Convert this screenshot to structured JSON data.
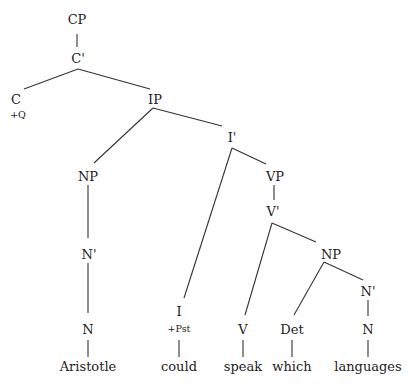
{
  "tree": {
    "nodes": [
      {
        "id": "cp",
        "label": "CP",
        "x": 77,
        "y": 24
      },
      {
        "id": "cbar",
        "label": "C'",
        "x": 78,
        "y": 60
      },
      {
        "id": "c",
        "label": "C",
        "x": 16,
        "y": 101
      },
      {
        "id": "c_feat",
        "label": "+Q",
        "x": 18,
        "y": 117
      },
      {
        "id": "ip",
        "label": "IP",
        "x": 155,
        "y": 101
      },
      {
        "id": "ibar",
        "label": "I'",
        "x": 232,
        "y": 139
      },
      {
        "id": "np1",
        "label": "NP",
        "x": 88,
        "y": 178
      },
      {
        "id": "vp",
        "label": "VP",
        "x": 275,
        "y": 178
      },
      {
        "id": "vbar",
        "label": "V'",
        "x": 273,
        "y": 213
      },
      {
        "id": "nbar1",
        "label": "N'",
        "x": 89,
        "y": 256
      },
      {
        "id": "np2",
        "label": "NP",
        "x": 331,
        "y": 256
      },
      {
        "id": "nbar2",
        "label": "N'",
        "x": 368,
        "y": 293
      },
      {
        "id": "n1",
        "label": "N",
        "x": 88,
        "y": 331
      },
      {
        "id": "i",
        "label": "I",
        "x": 179,
        "y": 313
      },
      {
        "id": "i_feat",
        "label": "+Pst",
        "x": 179,
        "y": 331
      },
      {
        "id": "v",
        "label": "V",
        "x": 243,
        "y": 331
      },
      {
        "id": "det",
        "label": "Det",
        "x": 292,
        "y": 331
      },
      {
        "id": "n2",
        "label": "N",
        "x": 368,
        "y": 331
      }
    ],
    "words": [
      {
        "id": "w_aristotle",
        "label": "Aristotle",
        "x": 88,
        "y": 371
      },
      {
        "id": "w_could",
        "label": "could",
        "x": 179,
        "y": 371
      },
      {
        "id": "w_speak",
        "label": "speak",
        "x": 243,
        "y": 371
      },
      {
        "id": "w_which",
        "label": "which",
        "x": 292,
        "y": 371
      },
      {
        "id": "w_languages",
        "label": "languages",
        "x": 368,
        "y": 371
      }
    ],
    "edges": [
      {
        "from": "CP",
        "to": "C'",
        "x1": 77,
        "y1": 34,
        "x2": 77,
        "y2": 47
      },
      {
        "from": "C'",
        "to": "C",
        "x1": 78,
        "y1": 69,
        "x2": 24,
        "y2": 89
      },
      {
        "from": "C'",
        "to": "IP",
        "x1": 78,
        "y1": 69,
        "x2": 150,
        "y2": 89
      },
      {
        "from": "IP",
        "to": "NP",
        "x1": 153,
        "y1": 108,
        "x2": 94,
        "y2": 163
      },
      {
        "from": "IP",
        "to": "I'",
        "x1": 153,
        "y1": 108,
        "x2": 222,
        "y2": 126
      },
      {
        "from": "NP",
        "to": "N'",
        "x1": 88,
        "y1": 185,
        "x2": 88,
        "y2": 238
      },
      {
        "from": "N'",
        "to": "N",
        "x1": 88,
        "y1": 263,
        "x2": 88,
        "y2": 313
      },
      {
        "from": "N",
        "to": "Aristotle",
        "x1": 88,
        "y1": 340,
        "x2": 88,
        "y2": 357
      },
      {
        "from": "I'",
        "to": "I",
        "x1": 232,
        "y1": 148,
        "x2": 184,
        "y2": 298
      },
      {
        "from": "I'",
        "to": "VP",
        "x1": 232,
        "y1": 148,
        "x2": 266,
        "y2": 164
      },
      {
        "from": "I",
        "to": "could",
        "x1": 179,
        "y1": 340,
        "x2": 179,
        "y2": 357
      },
      {
        "from": "VP",
        "to": "V'",
        "x1": 274,
        "y1": 185,
        "x2": 274,
        "y2": 200
      },
      {
        "from": "V'",
        "to": "V",
        "x1": 272,
        "y1": 223,
        "x2": 245,
        "y2": 315
      },
      {
        "from": "V'",
        "to": "NP",
        "x1": 272,
        "y1": 223,
        "x2": 316,
        "y2": 242
      },
      {
        "from": "V",
        "to": "speak",
        "x1": 243,
        "y1": 340,
        "x2": 243,
        "y2": 357
      },
      {
        "from": "NP",
        "to": "Det",
        "x1": 324,
        "y1": 262,
        "x2": 294,
        "y2": 315
      },
      {
        "from": "NP",
        "to": "N'",
        "x1": 324,
        "y1": 262,
        "x2": 363,
        "y2": 280
      },
      {
        "from": "Det",
        "to": "which",
        "x1": 292,
        "y1": 340,
        "x2": 292,
        "y2": 357
      },
      {
        "from": "N'",
        "to": "N",
        "x1": 368,
        "y1": 300,
        "x2": 368,
        "y2": 316
      },
      {
        "from": "N",
        "to": "languages",
        "x1": 368,
        "y1": 340,
        "x2": 368,
        "y2": 357
      }
    ],
    "line_color": "#333333",
    "text_color": "#222222"
  }
}
